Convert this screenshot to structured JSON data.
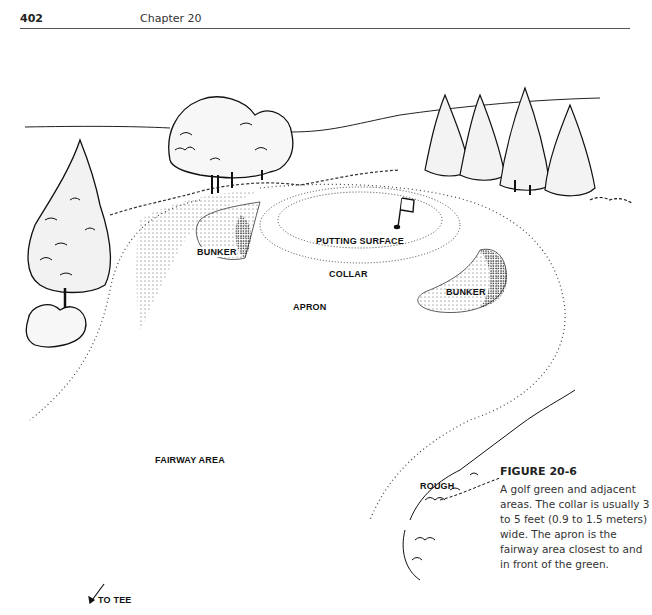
{
  "header": {
    "page_number": "402",
    "chapter": "Chapter 20"
  },
  "figure": {
    "labels": {
      "putting_surface": "PUTTING SURFACE",
      "bunker_left": "BUNKER",
      "bunker_right": "BUNKER",
      "collar": "COLLAR",
      "apron": "APRON",
      "fairway": "FAIRWAY AREA",
      "rough": "ROUGH",
      "to_tee": "TO TEE"
    },
    "caption_title": "FIGURE 20-6",
    "caption_text": "A golf green and adjacent areas. The collar is usually 3 to 5 feet (0.9 to 1.5 meters) wide. The apron is the fairway area closest to and in front of the green."
  }
}
